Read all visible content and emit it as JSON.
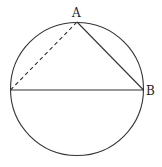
{
  "diagram": {
    "type": "geometry",
    "circle": {
      "cx": 77,
      "cy": 89,
      "r": 66.5
    },
    "points": {
      "A": {
        "label": "A",
        "x": 77,
        "y": 22
      },
      "B": {
        "label": "B",
        "x": 143.5,
        "y": 90
      },
      "C": {
        "label": "",
        "x": 10.5,
        "y": 90
      }
    },
    "segments": [
      {
        "from": "A",
        "to": "B",
        "style": "solid"
      },
      {
        "from": "C",
        "to": "B",
        "style": "solid",
        "note": "diameter"
      },
      {
        "from": "C",
        "to": "A",
        "style": "dashed"
      }
    ],
    "stroke_color": "#333333"
  }
}
